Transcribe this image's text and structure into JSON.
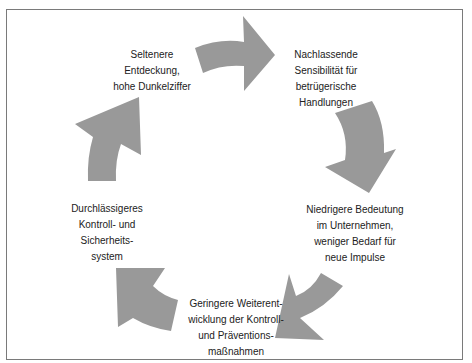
{
  "diagram": {
    "type": "cycle",
    "arrow_color": "#999999",
    "border_color": "#7a7a7a",
    "nodes": [
      {
        "id": "n1",
        "text": "Seltenere\nEntdeckung,\nhohe Dunkelziffer"
      },
      {
        "id": "n2",
        "text": "Nachlassende\nSensibilität für\nbetrügerische\nHandlungen"
      },
      {
        "id": "n3",
        "text": "Niedrigere Bedeutung\nim Unternehmen,\nweniger Bedarf für\nneue Impulse"
      },
      {
        "id": "n4",
        "text": "Geringere Weiterent-\nwicklung der Kontroll-\nund Präventions-\nmaßnahmen"
      },
      {
        "id": "n5",
        "text": "Durchlässigeres\nKontroll- und\nSicherheits-\nsystem"
      }
    ],
    "edges": [
      {
        "from": "n1",
        "to": "n2"
      },
      {
        "from": "n2",
        "to": "n3"
      },
      {
        "from": "n3",
        "to": "n4"
      },
      {
        "from": "n4",
        "to": "n5"
      },
      {
        "from": "n5",
        "to": "n1"
      }
    ]
  }
}
